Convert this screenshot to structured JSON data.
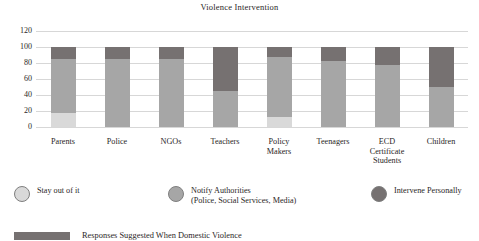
{
  "chart_data": {
    "type": "bar",
    "title": "Violence Intervention",
    "xlabel": "",
    "ylabel": "",
    "ylim": [
      0,
      120
    ],
    "yticks": [
      120,
      100,
      80,
      60,
      40,
      20,
      0
    ],
    "grid": true,
    "stacked": true,
    "legend_position": "bottom",
    "categories": [
      "Parents",
      "Police",
      "NGOs",
      "Teachers",
      "Policy\nMakers",
      "Teenagers",
      "ECD\nCertificate\nStudents",
      "Children"
    ],
    "series": [
      {
        "name": "Stay out of it",
        "color": "#d9d9d9",
        "values": [
          18,
          0,
          0,
          0,
          13,
          0,
          0,
          0
        ]
      },
      {
        "name": "Notify Authorities (Police, Social Services, Media)",
        "color": "#a6a6a6",
        "values": [
          67,
          85,
          85,
          45,
          74,
          82,
          77,
          50
        ]
      },
      {
        "name": "Intervene Personally",
        "color": "#767171",
        "values": [
          15,
          15,
          15,
          55,
          13,
          18,
          23,
          50
        ]
      }
    ],
    "totals": [
      100,
      100,
      100,
      100,
      100,
      100,
      100,
      100
    ]
  },
  "chart": {
    "title": "Violence Intervention",
    "ytick_labels": [
      "120",
      "100",
      "80",
      "60",
      "40",
      "20",
      "0"
    ],
    "category_labels": [
      [
        "Parents"
      ],
      [
        "Police"
      ],
      [
        "NGOs"
      ],
      [
        "Teachers"
      ],
      [
        "Policy",
        "Makers"
      ],
      [
        "Teenagers"
      ],
      [
        "ECD",
        "Certificate",
        "Students"
      ],
      [
        "Children"
      ]
    ]
  },
  "legend": {
    "items": [
      {
        "label": "Stay out of it",
        "label2": "",
        "color": "#d9d9d9"
      },
      {
        "label": "Notify Authorities",
        "label2": "(Police, Social Services, Media)",
        "color": "#a6a6a6"
      },
      {
        "label": "Intervene Personally",
        "label2": "",
        "color": "#767171"
      }
    ]
  },
  "footer": {
    "caption": "Responses Suggested When Domestic Violence"
  }
}
